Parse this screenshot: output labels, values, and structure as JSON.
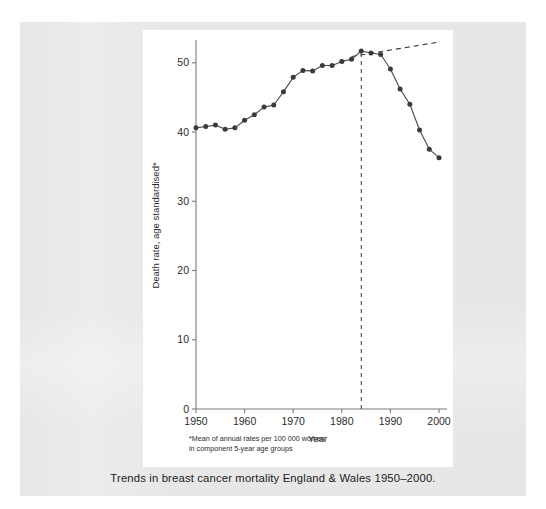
{
  "caption": "Trends in breast cancer mortality England & Wales 1950–2000.",
  "footnote": {
    "marker": "*",
    "line1": "Mean of annual rates per 100 000 women",
    "line2": "in component 5-year age groups"
  },
  "colors": {
    "page_background": "#ffffff",
    "scan_background": "#e7e7e7",
    "figure_background": "#ffffff",
    "axis": "#7a7a7a",
    "series": "#3a3a3a",
    "trend": "#3a3a3a",
    "text": "#2b2b2b"
  },
  "chart_data": {
    "type": "line",
    "title": "",
    "xlabel": "Year",
    "ylabel": "Death rate, age standardised*",
    "xlim": [
      1950,
      2000
    ],
    "ylim": [
      0,
      53
    ],
    "grid": false,
    "legend": null,
    "xticks": [
      1950,
      1960,
      1970,
      1980,
      1990,
      2000
    ],
    "xtick_labels": [
      "1950",
      "1960",
      "1970",
      "1980",
      "1990",
      "2000"
    ],
    "yticks": [
      0,
      10,
      20,
      30,
      40,
      50
    ],
    "ytick_labels": [
      "0",
      "10",
      "20",
      "30",
      "40",
      "50"
    ],
    "series": [
      {
        "name": "Death rate, age standardised",
        "style": "solid-with-markers",
        "x": [
          1950,
          1952,
          1954,
          1956,
          1958,
          1960,
          1962,
          1964,
          1966,
          1968,
          1970,
          1972,
          1974,
          1976,
          1978,
          1980,
          1982,
          1984,
          1986,
          1988,
          1990,
          1992,
          1994,
          1996,
          1998,
          2000
        ],
        "values": [
          40.6,
          40.8,
          41.0,
          40.4,
          40.6,
          41.7,
          42.5,
          43.6,
          43.9,
          45.8,
          47.9,
          48.9,
          48.8,
          49.6,
          49.6,
          50.2,
          50.5,
          51.7,
          51.4,
          51.2,
          49.1,
          46.2,
          44.0,
          40.3,
          37.5,
          36.3
        ]
      },
      {
        "name": "Projected trend",
        "style": "dashed",
        "x": [
          1982,
          2000
        ],
        "values": [
          50.9,
          53.0
        ]
      }
    ],
    "annotations": [
      {
        "type": "vertical-dashed-line",
        "x": 1984,
        "y_from": 0,
        "y_to": 51.7,
        "label": ""
      }
    ]
  }
}
